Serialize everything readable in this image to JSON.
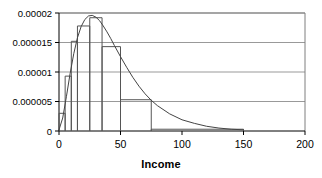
{
  "chart_data": {
    "type": "bar",
    "title": "",
    "subtitle": "",
    "xlabel": "Income",
    "ylabel": "",
    "xlim": [
      0,
      200
    ],
    "ylim": [
      0,
      2e-05
    ],
    "grid": true,
    "grid_axis": "y",
    "legend": false,
    "legend_position": "none",
    "xticks": [
      0,
      50,
      100,
      150,
      200
    ],
    "xticklabels": [
      "0",
      "50",
      "100",
      "150",
      "200"
    ],
    "yticks": [
      0,
      5e-06,
      1e-05,
      1.5e-05,
      2e-05
    ],
    "yticklabels": [
      "0",
      "0.000005",
      "0.00001",
      "0.000015",
      "0.00002"
    ],
    "bin_edges": [
      0,
      5,
      10,
      15,
      25,
      35,
      50,
      75,
      150
    ],
    "bar_heights": [
      3e-06,
      9.3e-06,
      1.52e-05,
      1.78e-05,
      1.92e-05,
      1.43e-05,
      5.3e-06,
      3e-07
    ],
    "series": [
      {
        "name": "Histogram",
        "type": "bar",
        "bin_edges": [
          0,
          5,
          10,
          15,
          25,
          35,
          50,
          75,
          150
        ],
        "values": [
          3e-06,
          9.3e-06,
          1.52e-05,
          1.78e-05,
          1.92e-05,
          1.43e-05,
          5.3e-06,
          3e-07
        ]
      },
      {
        "name": "Fitted density curve",
        "type": "line",
        "x": [
          0,
          3,
          6,
          9,
          12,
          15,
          18,
          21,
          24,
          27,
          30,
          33,
          36,
          39,
          42,
          45,
          50,
          55,
          60,
          65,
          70,
          75,
          80,
          90,
          100,
          110,
          120,
          130,
          140,
          150
        ],
        "y": [
          2e-07,
          2.2e-06,
          5.8e-06,
          9.7e-06,
          1.31e-05,
          1.58e-05,
          1.77e-05,
          1.89e-05,
          1.95e-05,
          1.96e-05,
          1.93e-05,
          1.87e-05,
          1.78e-05,
          1.68e-05,
          1.57e-05,
          1.45e-05,
          1.26e-05,
          1.08e-05,
          9.1e-06,
          7.6e-06,
          6.3e-06,
          5.2e-06,
          4.3e-06,
          2.9e-06,
          1.9e-06,
          1.3e-06,
          8e-07,
          5e-07,
          3e-07,
          2e-07
        ]
      }
    ],
    "colors": {
      "axis": "#000000",
      "grid": "#999999",
      "bar_edge": "#555555",
      "bar_fill": "none",
      "curve": "#444444",
      "text": "#000000",
      "background": "#ffffff"
    }
  }
}
